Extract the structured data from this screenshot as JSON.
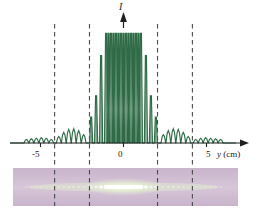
{
  "figure": {
    "title": "",
    "domain": "physics-diffraction-figure",
    "background_color": "#ffffff"
  },
  "axes": {
    "vertical_axis_label": "I",
    "horizontal_axis_label": "y",
    "horizontal_axis_unit": "(cm)",
    "tick_labels": [
      "-5",
      "0",
      "5"
    ],
    "tick_values": [
      -5,
      0,
      5
    ],
    "axis_color": "#1f1f1f",
    "curve_color": "#2f6b46"
  },
  "markers": {
    "dashed_line_color": "#4a4a4a",
    "dashed_positions_cm": [
      -4.15,
      -2.05,
      2.05,
      4.15
    ],
    "description": "dashed vertical guide lines linking envelope minima to photo strip"
  },
  "strip": {
    "background_color": "#cdb9cf",
    "fringe_color": "#e8f6d8",
    "bright_center_color": "#ffffff",
    "description": "photograph of multiple-slit interference fringes"
  },
  "chart_data": {
    "type": "line",
    "title": "",
    "xlabel": "y (cm)",
    "ylabel": "I",
    "xlim": [
      -6.3,
      6.3
    ],
    "ylim": [
      0,
      1.0
    ],
    "grid": false,
    "legend": null,
    "annotations": [
      {
        "text": "I",
        "x": 0.0,
        "y": 1.0,
        "kind": "axis-arrow-label"
      },
      {
        "text": "-5",
        "x": -5.0,
        "y": 0.0,
        "kind": "tick"
      },
      {
        "text": "0",
        "x": 0.0,
        "y": 0.0,
        "kind": "tick"
      },
      {
        "text": "5",
        "x": 5.0,
        "y": 0.0,
        "kind": "tick"
      },
      {
        "text": "y (cm)",
        "x": 6.0,
        "y": 0.0,
        "kind": "axis-label"
      }
    ],
    "series": [
      {
        "name": "Intensity",
        "color": "#2f6b46",
        "description": "N-slit interference pattern modulated by single-slit diffraction envelope; principal maxima spaced ~0.30 cm, envelope minima at y = +/-2.05 and +/-4.15 cm",
        "principal_maxima": [
          {
            "y": -1.95,
            "I": 0.22
          },
          {
            "y": -1.65,
            "I": 0.4
          },
          {
            "y": -1.35,
            "I": 0.74
          },
          {
            "y": -1.05,
            "I": 0.93
          },
          {
            "y": -0.9,
            "I": 0.93
          },
          {
            "y": -0.75,
            "I": 0.93
          },
          {
            "y": -0.6,
            "I": 0.93
          },
          {
            "y": -0.45,
            "I": 0.93
          },
          {
            "y": -0.3,
            "I": 0.93
          },
          {
            "y": -0.15,
            "I": 0.93
          },
          {
            "y": 0.0,
            "I": 0.93
          },
          {
            "y": 0.15,
            "I": 0.93
          },
          {
            "y": 0.3,
            "I": 0.93
          },
          {
            "y": 0.45,
            "I": 0.93
          },
          {
            "y": 0.6,
            "I": 0.93
          },
          {
            "y": 0.75,
            "I": 0.93
          },
          {
            "y": 0.9,
            "I": 0.93
          },
          {
            "y": 1.05,
            "I": 0.93
          },
          {
            "y": 1.35,
            "I": 0.74
          },
          {
            "y": 1.65,
            "I": 0.4
          },
          {
            "y": 1.95,
            "I": 0.22
          }
        ],
        "secondary_maxima": [
          {
            "y": -5.85,
            "I": 0.03
          },
          {
            "y": -5.55,
            "I": 0.035
          },
          {
            "y": -5.25,
            "I": 0.04
          },
          {
            "y": -4.95,
            "I": 0.045
          },
          {
            "y": -4.65,
            "I": 0.04
          },
          {
            "y": -4.35,
            "I": 0.03
          },
          {
            "y": -3.9,
            "I": 0.055
          },
          {
            "y": -3.6,
            "I": 0.09
          },
          {
            "y": -3.3,
            "I": 0.115
          },
          {
            "y": -3.0,
            "I": 0.12
          },
          {
            "y": -2.7,
            "I": 0.105
          },
          {
            "y": -2.4,
            "I": 0.07
          },
          {
            "y": 2.4,
            "I": 0.07
          },
          {
            "y": 2.7,
            "I": 0.105
          },
          {
            "y": 3.0,
            "I": 0.12
          },
          {
            "y": 3.3,
            "I": 0.115
          },
          {
            "y": 3.6,
            "I": 0.09
          },
          {
            "y": 3.9,
            "I": 0.055
          },
          {
            "y": 4.35,
            "I": 0.03
          },
          {
            "y": 4.65,
            "I": 0.04
          },
          {
            "y": 4.95,
            "I": 0.045
          },
          {
            "y": 5.25,
            "I": 0.04
          },
          {
            "y": 5.55,
            "I": 0.035
          },
          {
            "y": 5.85,
            "I": 0.03
          }
        ]
      }
    ]
  }
}
